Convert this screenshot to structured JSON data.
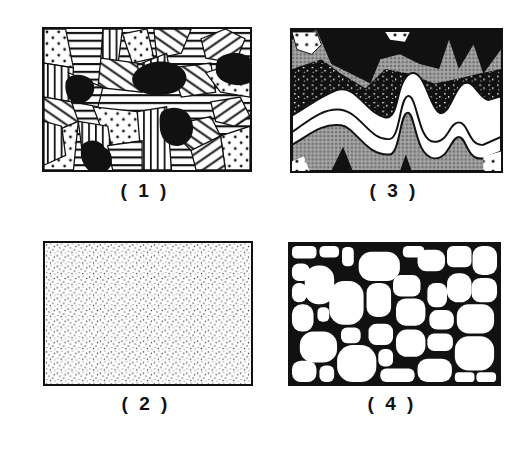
{
  "figure": {
    "panels": [
      {
        "id": "1",
        "label": "( 1 )",
        "texture": "polycrystalline-mosaic-with-dark-inclusions",
        "fill_patterns": [
          "horizontal-lines",
          "vertical-lines",
          "diagonal-lines",
          "dotted",
          "solid-black"
        ]
      },
      {
        "id": "2",
        "label": "( 2 )",
        "texture": "fine-uniform-stipple"
      },
      {
        "id": "3",
        "label": "( 3 )",
        "texture": "folded-wavy-layers",
        "fill_patterns": [
          "solid-black",
          "speckled-black",
          "grey-stipple",
          "white-band",
          "dotted"
        ]
      },
      {
        "id": "4",
        "label": "( 4 )",
        "texture": "rounded-grain-aggregate"
      }
    ],
    "colors": {
      "ink": "#111111",
      "paper": "#ffffff",
      "grey": "#8a8a8a"
    }
  }
}
